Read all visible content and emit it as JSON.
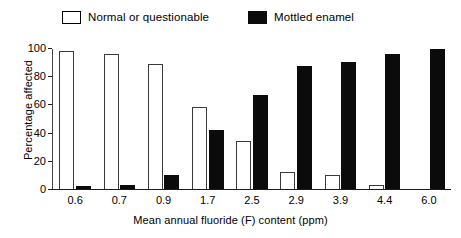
{
  "chart_data": {
    "type": "bar",
    "title": "",
    "xlabel": "Mean annual fluoride (F) content (ppm)",
    "ylabel": "Percentage affected",
    "categories": [
      "0.6",
      "0.7",
      "0.9",
      "1.7",
      "2.5",
      "2.9",
      "3.9",
      "4.4",
      "6.0"
    ],
    "series": [
      {
        "name": "Normal or questionable",
        "color": "#ffffff",
        "values": [
          98,
          96,
          89,
          58,
          34,
          12,
          10,
          3,
          0
        ]
      },
      {
        "name": "Mottled enamel",
        "color": "#0b0b0b",
        "values": [
          2,
          3,
          10,
          42,
          67,
          87,
          90,
          96,
          99
        ]
      }
    ],
    "ylim": [
      0,
      100
    ],
    "yticks": [
      "0",
      "20",
      "40",
      "60",
      "80",
      "100"
    ],
    "grid": false,
    "legend_position": "top"
  },
  "legend": {
    "entries": [
      {
        "label": "Normal or questionable",
        "swatch": "open-square-swatch"
      },
      {
        "label": "Mottled enamel",
        "swatch": "filled-square-swatch"
      }
    ]
  },
  "axes": {
    "y_title": "Percentage affected",
    "x_title": "Mean annual fluoride (F) content (ppm)"
  }
}
